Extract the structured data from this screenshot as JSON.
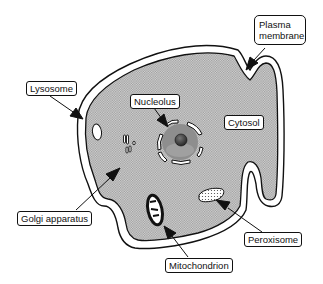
{
  "diagram": {
    "colors": {
      "background": "#ffffff",
      "cytosol_fill": "#c8c8c8",
      "outline": "#111111",
      "membrane_gap": "#ffffff",
      "nucleus_fill": "#8a8a8a",
      "nucleolus_fill": "#3a3a3a"
    },
    "labels": {
      "lysosome": "Lysosome",
      "nucleolus": "Nucleolus",
      "plasma_membrane_line1": "Plasma",
      "plasma_membrane_line2": "membrane",
      "cytosol": "Cytosol",
      "golgi_apparatus": "Golgi apparatus",
      "peroxisome": "Peroxisome",
      "mitochondrion": "Mitochondrion"
    }
  }
}
